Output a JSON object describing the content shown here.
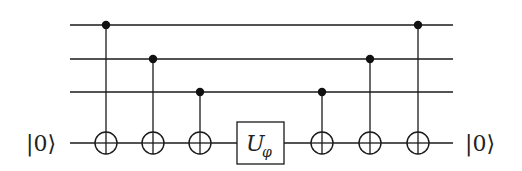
{
  "diagram": {
    "type": "quantum-circuit",
    "wires": [
      {
        "id": "q1",
        "y": 25
      },
      {
        "id": "q2",
        "y": 59
      },
      {
        "id": "q3",
        "y": 92
      },
      {
        "id": "ancilla",
        "y": 143,
        "input_label": "|0⟩",
        "output_label": "|0⟩"
      }
    ],
    "gates": [
      {
        "type": "CNOT",
        "control": "q1",
        "target": "ancilla",
        "x": 106
      },
      {
        "type": "CNOT",
        "control": "q2",
        "target": "ancilla",
        "x": 153
      },
      {
        "type": "CNOT",
        "control": "q3",
        "target": "ancilla",
        "x": 200
      },
      {
        "type": "U",
        "target": "ancilla",
        "label": "U",
        "subscript": "φ",
        "x": 260
      },
      {
        "type": "CNOT",
        "control": "q3",
        "target": "ancilla",
        "x": 322
      },
      {
        "type": "CNOT",
        "control": "q2",
        "target": "ancilla",
        "x": 370
      },
      {
        "type": "CNOT",
        "control": "q1",
        "target": "ancilla",
        "x": 418
      }
    ],
    "labels": {
      "input": "|0⟩",
      "output": "|0⟩",
      "gate_main": "U",
      "gate_sub": "φ"
    }
  }
}
